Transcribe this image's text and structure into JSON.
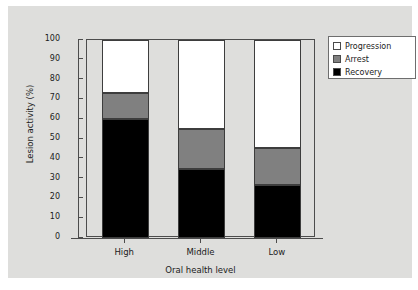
{
  "chart_data": {
    "type": "bar",
    "subtype": "stacked-100",
    "title": "",
    "xlabel": "Oral health level",
    "ylabel": "Lesion activity (%)",
    "categories": [
      "High",
      "Middle",
      "Low"
    ],
    "series": [
      {
        "name": "Recovery",
        "values": [
          60,
          35,
          27
        ],
        "color": "#000000"
      },
      {
        "name": "Arrest",
        "values": [
          13,
          20,
          18.5
        ],
        "color": "#808080"
      },
      {
        "name": "Progression",
        "values": [
          27,
          45,
          54.5
        ],
        "color": "#ffffff"
      }
    ],
    "cumulative_tops": {
      "Recovery": [
        60,
        35,
        27
      ],
      "Arrest": [
        73,
        55,
        45.5
      ],
      "Progression": [
        100,
        100,
        100
      ]
    },
    "ylim": [
      0,
      100
    ],
    "ytick_labels": [
      "100",
      "90",
      "80",
      "70",
      "60",
      "50",
      "40",
      "30",
      "20",
      "10",
      "0"
    ],
    "ytick_values": [
      100,
      90,
      80,
      70,
      60,
      50,
      40,
      30,
      20,
      10,
      0
    ],
    "grid": false,
    "legend_position": "upper-right-outside"
  },
  "legend": {
    "items": [
      {
        "label": "Progression",
        "swatch": "#ffffff"
      },
      {
        "label": "Arrest",
        "swatch": "#808080"
      },
      {
        "label": "Recovery",
        "swatch": "#000000"
      }
    ]
  },
  "colors": {
    "panel_background": "#dededc",
    "figure_background": "#ffffff",
    "axis": "#4c4c4c",
    "text": "#1b1b1b",
    "bar_outline": "#3d3d3d"
  }
}
